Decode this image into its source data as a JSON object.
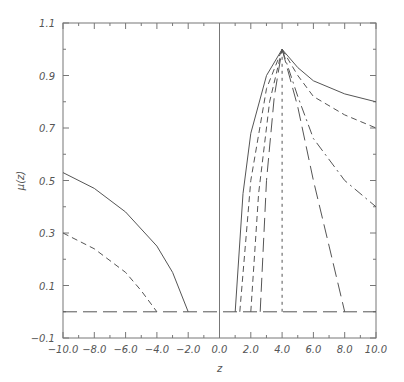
{
  "chart_data": {
    "type": "line",
    "title": "",
    "xlabel": "z",
    "ylabel": "μ(z)",
    "xlim": [
      -10,
      10
    ],
    "ylim": [
      -0.1,
      1.1
    ],
    "x_ticks": [
      "-10.0",
      "-8.0",
      "-6.0",
      "-4.0",
      "-2.0",
      "0.0",
      "2.0",
      "4.0",
      "6.0",
      "8.0",
      "10.0"
    ],
    "y_ticks": [
      "1.1",
      "0.9",
      "0.7",
      "0.5",
      "0.3",
      "0.1",
      "-0.1"
    ],
    "grid": false,
    "legend": null,
    "series": [
      {
        "name": "left-solid",
        "style": "solid",
        "points": [
          [
            -10,
            0.53
          ],
          [
            -8,
            0.47
          ],
          [
            -6,
            0.38
          ],
          [
            -4,
            0.25
          ],
          [
            -3,
            0.15
          ],
          [
            -2,
            0.0
          ]
        ]
      },
      {
        "name": "left-dashed",
        "style": "dashed",
        "points": [
          [
            -10,
            0.3
          ],
          [
            -8,
            0.24
          ],
          [
            -6,
            0.15
          ],
          [
            -5,
            0.08
          ],
          [
            -4,
            0.0
          ]
        ]
      },
      {
        "name": "baseline",
        "style": "long-dash",
        "points": [
          [
            -10,
            0.0
          ],
          [
            10,
            0.0
          ]
        ]
      },
      {
        "name": "rise-solid",
        "style": "solid",
        "points": [
          [
            1.0,
            0.0
          ],
          [
            1.5,
            0.45
          ],
          [
            2.0,
            0.68
          ],
          [
            3.0,
            0.9
          ],
          [
            4.0,
            1.0
          ]
        ]
      },
      {
        "name": "rise-dash-1",
        "style": "dashed",
        "points": [
          [
            1.3,
            0.0
          ],
          [
            2.0,
            0.5
          ],
          [
            3.0,
            0.85
          ],
          [
            4.0,
            1.0
          ]
        ]
      },
      {
        "name": "rise-dash-2",
        "style": "dashed",
        "points": [
          [
            2.0,
            0.0
          ],
          [
            2.5,
            0.45
          ],
          [
            3.2,
            0.8
          ],
          [
            4.0,
            1.0
          ]
        ]
      },
      {
        "name": "rise-dash-3",
        "style": "long-dash",
        "points": [
          [
            2.6,
            0.0
          ],
          [
            3.0,
            0.5
          ],
          [
            3.5,
            0.82
          ],
          [
            4.0,
            1.0
          ]
        ]
      },
      {
        "name": "vertical-dotted",
        "style": "dotted",
        "points": [
          [
            4.0,
            0.0
          ],
          [
            4.0,
            1.0
          ]
        ]
      },
      {
        "name": "decay-solid",
        "style": "solid",
        "points": [
          [
            4.0,
            1.0
          ],
          [
            5.0,
            0.93
          ],
          [
            6.0,
            0.88
          ],
          [
            8.0,
            0.83
          ],
          [
            10.0,
            0.8
          ]
        ]
      },
      {
        "name": "decay-dashed",
        "style": "dashed",
        "points": [
          [
            4.0,
            1.0
          ],
          [
            5.0,
            0.9
          ],
          [
            6.0,
            0.82
          ],
          [
            8.0,
            0.75
          ],
          [
            10.0,
            0.7
          ]
        ]
      },
      {
        "name": "decay-dash-dot",
        "style": "dash-dot",
        "points": [
          [
            4.0,
            1.0
          ],
          [
            5.0,
            0.82
          ],
          [
            6.0,
            0.66
          ],
          [
            8.0,
            0.5
          ],
          [
            10.0,
            0.4
          ]
        ]
      },
      {
        "name": "decay-long-dash",
        "style": "long-dash",
        "points": [
          [
            4.0,
            1.0
          ],
          [
            5.0,
            0.78
          ],
          [
            6.0,
            0.5
          ],
          [
            7.0,
            0.25
          ],
          [
            8.0,
            0.0
          ]
        ]
      }
    ]
  }
}
